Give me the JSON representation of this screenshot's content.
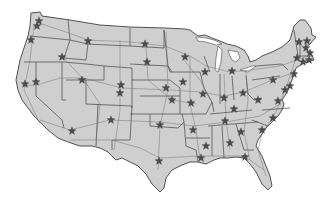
{
  "map": {
    "title": "United States map with state capitals",
    "colors": {
      "background": "#ffffff",
      "land": "#cfcfcf",
      "border": "#4e4e4e",
      "highway": "#6e6e6e",
      "star": "#4d4d4d"
    },
    "marker_icon": "star-icon",
    "markers": [
      {
        "name": "Olympia",
        "x": 37,
        "y": 26
      },
      {
        "name": "Seattle",
        "x": 39,
        "y": 21
      },
      {
        "name": "Salem",
        "x": 31,
        "y": 40
      },
      {
        "name": "Boise",
        "x": 62,
        "y": 57
      },
      {
        "name": "Helena",
        "x": 88,
        "y": 41
      },
      {
        "name": "Sacramento",
        "x": 25,
        "y": 84
      },
      {
        "name": "Carson City",
        "x": 36,
        "y": 82
      },
      {
        "name": "Salt Lake City",
        "x": 82,
        "y": 80
      },
      {
        "name": "Cheyenne",
        "x": 121,
        "y": 85
      },
      {
        "name": "Denver",
        "x": 120,
        "y": 93
      },
      {
        "name": "Phoenix",
        "x": 72,
        "y": 131
      },
      {
        "name": "Santa Fe",
        "x": 111,
        "y": 120
      },
      {
        "name": "Bismarck",
        "x": 145,
        "y": 44
      },
      {
        "name": "Pierre",
        "x": 147,
        "y": 62
      },
      {
        "name": "Lincoln",
        "x": 166,
        "y": 88
      },
      {
        "name": "Topeka",
        "x": 172,
        "y": 100
      },
      {
        "name": "Oklahoma City",
        "x": 160,
        "y": 125
      },
      {
        "name": "Austin",
        "x": 159,
        "y": 161
      },
      {
        "name": "St. Paul",
        "x": 185,
        "y": 57
      },
      {
        "name": "Des Moines",
        "x": 183,
        "y": 82
      },
      {
        "name": "Jefferson City",
        "x": 191,
        "y": 103
      },
      {
        "name": "Little Rock",
        "x": 193,
        "y": 130
      },
      {
        "name": "Baton Rouge",
        "x": 201,
        "y": 158
      },
      {
        "name": "Madison",
        "x": 205,
        "y": 72
      },
      {
        "name": "Springfield",
        "x": 203,
        "y": 94
      },
      {
        "name": "Lansing",
        "x": 232,
        "y": 71
      },
      {
        "name": "Indianapolis",
        "x": 224,
        "y": 98
      },
      {
        "name": "Columbus",
        "x": 243,
        "y": 93
      },
      {
        "name": "Frankfort",
        "x": 234,
        "y": 109
      },
      {
        "name": "Nashville",
        "x": 225,
        "y": 121
      },
      {
        "name": "Jackson",
        "x": 206,
        "y": 146
      },
      {
        "name": "Montgomery",
        "x": 230,
        "y": 143
      },
      {
        "name": "Atlanta",
        "x": 241,
        "y": 132
      },
      {
        "name": "Tallahassee",
        "x": 245,
        "y": 157
      },
      {
        "name": "Columbia",
        "x": 262,
        "y": 130
      },
      {
        "name": "Raleigh",
        "x": 273,
        "y": 118
      },
      {
        "name": "Richmond",
        "x": 278,
        "y": 101
      },
      {
        "name": "Charleston WV",
        "x": 258,
        "y": 100
      },
      {
        "name": "Harrisburg",
        "x": 273,
        "y": 80
      },
      {
        "name": "Annapolis",
        "x": 285,
        "y": 90
      },
      {
        "name": "Dover",
        "x": 290,
        "y": 86
      },
      {
        "name": "Trenton",
        "x": 294,
        "y": 74
      },
      {
        "name": "Albany",
        "x": 297,
        "y": 58
      },
      {
        "name": "Hartford",
        "x": 303,
        "y": 62
      },
      {
        "name": "Providence",
        "x": 309,
        "y": 60
      },
      {
        "name": "Boston",
        "x": 310,
        "y": 53
      },
      {
        "name": "Concord",
        "x": 306,
        "y": 48
      },
      {
        "name": "Montpelier",
        "x": 299,
        "y": 42
      },
      {
        "name": "Augusta",
        "x": 307,
        "y": 41
      }
    ]
  }
}
